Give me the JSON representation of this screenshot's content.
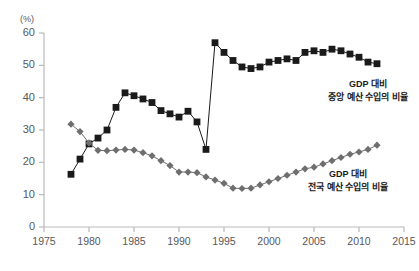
{
  "chart_data": {
    "type": "line",
    "title": "",
    "subtitle": "",
    "xlabel": "",
    "ylabel": "",
    "yunit": "(%)",
    "xlim": [
      1975,
      2015
    ],
    "ylim": [
      0,
      60
    ],
    "grid": false,
    "legend_position": "inline-annotation",
    "xticks": [
      "1975",
      "1980",
      "1985",
      "1990",
      "1995",
      "2000",
      "2005",
      "2010",
      "2015"
    ],
    "xtick_values": [
      1975,
      1980,
      1985,
      1990,
      1995,
      2000,
      2005,
      2010,
      2015
    ],
    "yticks": [
      "0",
      "10",
      "20",
      "30",
      "40",
      "50",
      "60"
    ],
    "ytick_values": [
      0,
      10,
      20,
      30,
      40,
      50,
      60
    ],
    "series": [
      {
        "name": "GDP 대비 중앙 예산 수입의 비율",
        "annotation_lines": [
          "GDP 대비",
          "중앙 예산 수입의 비율"
        ],
        "color": "#1a1a1a",
        "marker": "square",
        "x": [
          1978,
          1979,
          1980,
          1981,
          1982,
          1983,
          1984,
          1985,
          1986,
          1987,
          1988,
          1989,
          1990,
          1991,
          1992,
          1993,
          1994,
          1995,
          1996,
          1997,
          1998,
          1999,
          2000,
          2001,
          2002,
          2003,
          2004,
          2005,
          2006,
          2007,
          2008,
          2009,
          2010,
          2011,
          2012
        ],
        "y": [
          16.3,
          21.0,
          25.7,
          27.5,
          30.0,
          37.0,
          41.5,
          40.6,
          39.6,
          38.5,
          36.0,
          35.0,
          34.0,
          35.8,
          32.5,
          24.0,
          57.0,
          54.0,
          51.5,
          49.5,
          49.0,
          49.5,
          51.0,
          51.5,
          52.0,
          51.5,
          54.0,
          54.5,
          54.0,
          55.0,
          54.5,
          53.5,
          52.5,
          51.0,
          50.5
        ]
      },
      {
        "name": "GDP 대비 전국 예산 수입의 비율",
        "annotation_lines": [
          "GDP 대비",
          "전국 예산 수입의 비율"
        ],
        "color": "#6e6e70",
        "marker": "diamond",
        "x": [
          1978,
          1979,
          1980,
          1981,
          1982,
          1983,
          1984,
          1985,
          1986,
          1987,
          1988,
          1989,
          1990,
          1991,
          1992,
          1993,
          1994,
          1995,
          1996,
          1997,
          1998,
          1999,
          2000,
          2001,
          2002,
          2003,
          2004,
          2005,
          2006,
          2007,
          2008,
          2009,
          2010,
          2011,
          2012
        ],
        "y": [
          31.8,
          29.5,
          26.0,
          23.7,
          23.6,
          23.8,
          24.0,
          23.8,
          23.0,
          22.0,
          20.5,
          19.0,
          17.0,
          17.0,
          16.8,
          15.5,
          14.5,
          13.5,
          12.0,
          11.9,
          12.0,
          13.0,
          14.0,
          15.0,
          16.0,
          17.0,
          18.0,
          18.5,
          19.5,
          20.5,
          21.5,
          22.5,
          23.2,
          24.0,
          25.3
        ]
      }
    ]
  },
  "plot_geometry": {
    "left": 44,
    "right": 404,
    "top": 33,
    "bottom": 227
  },
  "annotations": {
    "central": {
      "x": 368,
      "y": 78
    },
    "national": {
      "x": 348,
      "y": 168
    }
  }
}
